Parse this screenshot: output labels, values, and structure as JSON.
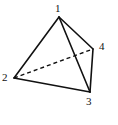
{
  "figure": {
    "kind": "tetrahedron-line-drawing",
    "width": 118,
    "height": 125,
    "background_color": "#ffffff",
    "stroke_color": "#111111",
    "stroke_width": 1.6,
    "vertices": [
      {
        "label": "1",
        "role": "apex",
        "x": 59,
        "y": 17,
        "label_x": 55,
        "label_y": 3
      },
      {
        "label": "2",
        "role": "base-left",
        "x": 14,
        "y": 78,
        "label_x": 2,
        "label_y": 72
      },
      {
        "label": "3",
        "role": "base-front",
        "x": 90,
        "y": 92,
        "label_x": 86,
        "label_y": 96
      },
      {
        "label": "4",
        "role": "base-right",
        "x": 93,
        "y": 49,
        "label_x": 99,
        "label_y": 41
      }
    ],
    "edges": [
      {
        "from": "1",
        "to": "2",
        "style": "solid",
        "hidden": false
      },
      {
        "from": "1",
        "to": "3",
        "style": "solid",
        "hidden": false
      },
      {
        "from": "1",
        "to": "4",
        "style": "solid",
        "hidden": false
      },
      {
        "from": "2",
        "to": "3",
        "style": "solid",
        "hidden": false
      },
      {
        "from": "3",
        "to": "4",
        "style": "solid",
        "hidden": false
      },
      {
        "from": "2",
        "to": "4",
        "style": "dashed",
        "hidden": true,
        "dash_pattern": "4 3"
      }
    ]
  }
}
